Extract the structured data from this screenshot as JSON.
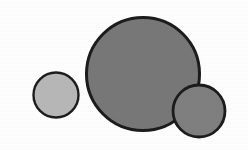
{
  "figure": {
    "background_color": "#ffffff",
    "width": 248,
    "height": 150,
    "outline_color": "#1c1c1c",
    "caption": "",
    "shapes": [
      {
        "name": "small-left-circle",
        "type": "circle",
        "cx": 56,
        "cy": 95,
        "r": 22.5,
        "diameter": 45,
        "fill": "#b8b8b8",
        "stroke": "#1f1f1f",
        "stroke_width": 2.4,
        "z_order": 1,
        "label": ""
      },
      {
        "name": "large-center-circle",
        "type": "circle",
        "cx": 143,
        "cy": 74,
        "r": 56.5,
        "diameter": 113,
        "fill": "#787878",
        "stroke": "#1a1a1a",
        "stroke_width": 3.0,
        "z_order": 2,
        "label": ""
      },
      {
        "name": "bottom-right-circle",
        "type": "circle",
        "cx": 199,
        "cy": 111,
        "r": 26,
        "diameter": 52,
        "fill": "#808080",
        "stroke": "#1a1a1a",
        "stroke_width": 2.8,
        "z_order": 3,
        "label": ""
      }
    ]
  },
  "chart_data": {
    "type": "scatter",
    "title": "",
    "subtitle": "",
    "xlabel": "",
    "ylabel": "",
    "grid": false,
    "legend": [],
    "annotations": [],
    "xlim": [
      0,
      248
    ],
    "ylim": [
      0,
      150
    ],
    "series": [
      {
        "name": "circles",
        "marker": "circle",
        "points": [
          {
            "label": "small-left-circle",
            "x": 56,
            "y": 95,
            "size": 45,
            "color": "#b8b8b8"
          },
          {
            "label": "large-center-circle",
            "x": 143,
            "y": 74,
            "size": 113,
            "color": "#787878"
          },
          {
            "label": "bottom-right-circle",
            "x": 199,
            "y": 111,
            "size": 52,
            "color": "#808080"
          }
        ]
      }
    ]
  }
}
